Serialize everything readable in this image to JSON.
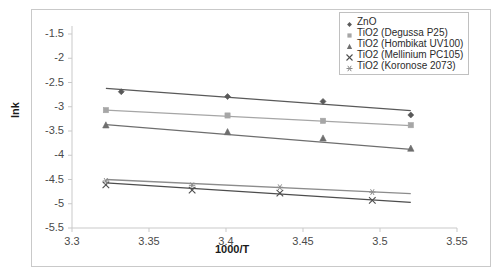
{
  "chart_data": {
    "type": "scatter",
    "title": "",
    "xlabel": "1000/T",
    "ylabel": "lnk",
    "xlim": [
      3.3,
      3.55
    ],
    "ylim": [
      -5.5,
      -1.5
    ],
    "xticks": [
      "3.3",
      "3.35",
      "3.4",
      "3.45",
      "3.5",
      "3.55"
    ],
    "xtick_values": [
      3.3,
      3.35,
      3.4,
      3.45,
      3.5,
      3.55
    ],
    "yticks": [
      "-1.5",
      "-2",
      "-2.5",
      "-3",
      "-3.5",
      "-4",
      "-4.5",
      "-5",
      "-5.5"
    ],
    "ytick_values": [
      -1.5,
      -2,
      -2.5,
      -3,
      -3.5,
      -4,
      -4.5,
      -5,
      -5.5
    ],
    "grid": false,
    "legend_position": "top-right",
    "series": [
      {
        "name": "ZnO",
        "marker": "diamond",
        "color": "#595959",
        "x": [
          3.332,
          3.401,
          3.463,
          3.52
        ],
        "y": [
          -2.69,
          -2.79,
          -2.89,
          -3.17
        ],
        "trendline": {
          "x": [
            3.322,
            3.52
          ],
          "y": [
            -2.62,
            -3.08
          ]
        }
      },
      {
        "name": "TiO2 (Degussa P25)",
        "marker": "square",
        "color": "#a6a6a6",
        "x": [
          3.322,
          3.401,
          3.463,
          3.52
        ],
        "y": [
          -3.07,
          -3.18,
          -3.29,
          -3.38
        ],
        "trendline": {
          "x": [
            3.322,
            3.52
          ],
          "y": [
            -3.07,
            -3.39
          ]
        }
      },
      {
        "name": "TiO2 (Hombikat UV100)",
        "marker": "triangle",
        "color": "#6e6e6e",
        "x": [
          3.322,
          3.401,
          3.463,
          3.52
        ],
        "y": [
          -3.38,
          -3.52,
          -3.65,
          -3.86
        ],
        "trendline": {
          "x": [
            3.322,
            3.52
          ],
          "y": [
            -3.37,
            -3.88
          ]
        }
      },
      {
        "name": "TiO2 (Mellinium PC105)",
        "marker": "cross",
        "color": "#4d4d4d",
        "x": [
          3.322,
          3.378,
          3.435,
          3.495
        ],
        "y": [
          -4.61,
          -4.72,
          -4.78,
          -4.93
        ],
        "trendline": {
          "x": [
            3.322,
            3.52
          ],
          "y": [
            -4.57,
            -4.97
          ]
        }
      },
      {
        "name": "TiO2 (Koronose 2073)",
        "marker": "asterisk",
        "color": "#8c8c8c",
        "x": [
          3.322,
          3.378,
          3.435,
          3.495
        ],
        "y": [
          -4.53,
          -4.62,
          -4.66,
          -4.76
        ],
        "trendline": {
          "x": [
            3.322,
            3.52
          ],
          "y": [
            -4.5,
            -4.79
          ]
        }
      }
    ]
  },
  "legend": {
    "items": [
      {
        "label": "ZnO"
      },
      {
        "label": "TiO2 (Degussa P25)"
      },
      {
        "label": "TiO2 (Hombikat UV100)"
      },
      {
        "label": "TiO2 (Mellinium PC105)"
      },
      {
        "label": "TiO2 (Koronose 2073)"
      }
    ]
  },
  "axes": {
    "y_axis_title": "lnk",
    "x_axis_title": "1000/T"
  },
  "colors": {
    "axis": "#c9c9c9",
    "tick_text": "#4a4a4a",
    "frame": "#c9c9c9",
    "background": "#ffffff"
  }
}
